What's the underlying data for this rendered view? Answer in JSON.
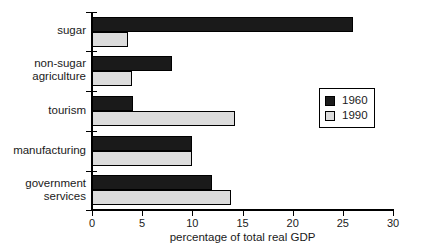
{
  "chart_data": {
    "type": "bar",
    "orientation": "horizontal",
    "title": "",
    "xlabel": "percentage of total real GDP",
    "ylabel": "",
    "xlim": [
      0,
      30
    ],
    "xticks": [
      0,
      5,
      10,
      15,
      20,
      25,
      30
    ],
    "xtick_labels": [
      "0",
      "5",
      "10",
      "15",
      "20",
      "25",
      "30"
    ],
    "grid": false,
    "legend_position": "right-middle",
    "categories": [
      "sugar",
      "non-sugar agriculture",
      "tourism",
      "manufacturing",
      "government services"
    ],
    "category_label_lines": [
      [
        "sugar"
      ],
      [
        "non-sugar",
        "agriculture"
      ],
      [
        "tourism"
      ],
      [
        "manufacturing"
      ],
      [
        "government",
        "services"
      ]
    ],
    "series": [
      {
        "name": "1960",
        "color": "#1a1a1a",
        "values": [
          26.0,
          8.0,
          4.1,
          10.0,
          12.0
        ]
      },
      {
        "name": "1990",
        "color": "#dcdcdc",
        "values": [
          3.6,
          4.0,
          14.3,
          10.0,
          13.9
        ]
      }
    ]
  },
  "legend": {
    "entries": [
      {
        "label": "1960",
        "swatch": "black-filled-square"
      },
      {
        "label": "1990",
        "swatch": "light-gray-square"
      }
    ]
  },
  "axis": {
    "x_title": "percentage of total real GDP",
    "x_tick_labels": [
      "0",
      "5",
      "10",
      "15",
      "20",
      "25",
      "30"
    ]
  }
}
